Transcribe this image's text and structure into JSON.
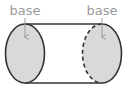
{
  "diagram": {
    "type": "cylinder-parts",
    "labels": {
      "left": "base",
      "right": "base"
    },
    "colors": {
      "outline": "#333333",
      "base_fill": "#d9d9d9",
      "label": "#9a9a9a",
      "arrow": "#9a9a9a",
      "background": "#ffffff"
    }
  }
}
